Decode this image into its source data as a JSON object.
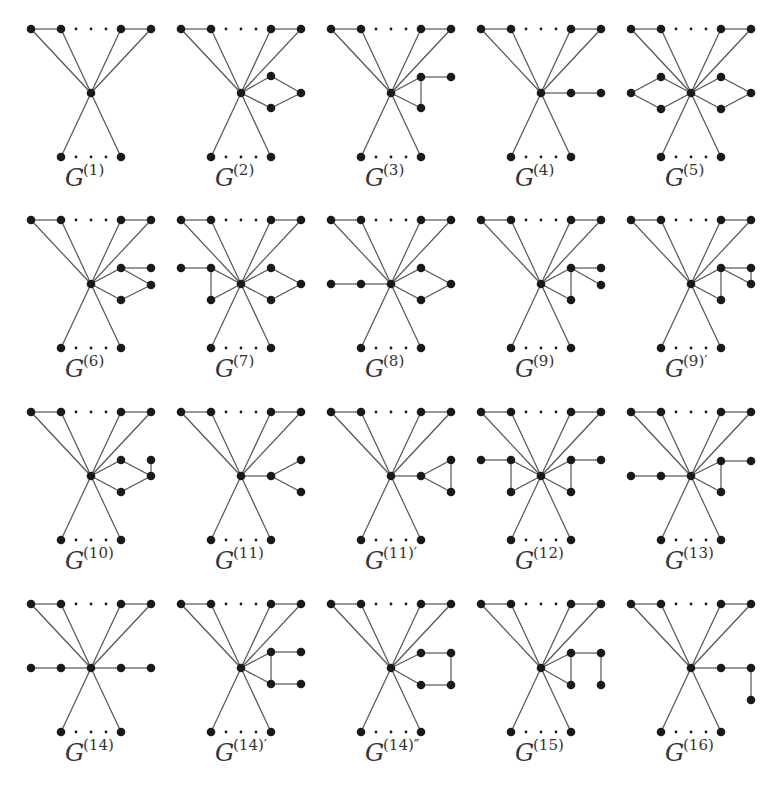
{
  "figure": {
    "caption_fragment": "",
    "colors": {
      "edge": "#555555",
      "node": "#1a1a1a",
      "label": "#333333",
      "background": "#ffffff"
    },
    "grid": {
      "columns": 5,
      "rows": 4,
      "col_width": 150,
      "first_center_x": 91,
      "row_center_y": [
        93,
        284,
        476,
        668
      ]
    },
    "base_structure": {
      "top_row": "four vertices at offsets -60,-30,+30,+60 (dy -64) with edges between outer pairs and dotted gap in the middle, all joined to center",
      "bottom_row": "two vertices at offsets -30,+30 (dy +64) joined to center, dotted gap between them"
    },
    "graphs": [
      {
        "id": "G1",
        "label": "G",
        "sup": "(1)",
        "row": 0,
        "col": 0,
        "nodes": [],
        "edges": []
      },
      {
        "id": "G2",
        "label": "G",
        "sup": "(2)",
        "row": 0,
        "col": 1,
        "nodes": [
          [
            30,
            -17
          ],
          [
            30,
            15
          ],
          [
            60,
            0
          ]
        ],
        "edges": [
          [
            "c",
            0
          ],
          [
            "c",
            1
          ],
          [
            0,
            2
          ],
          [
            1,
            2
          ]
        ]
      },
      {
        "id": "G3",
        "label": "G",
        "sup": "(3)",
        "row": 0,
        "col": 2,
        "nodes": [
          [
            30,
            -16
          ],
          [
            60,
            -16
          ],
          [
            30,
            15
          ]
        ],
        "edges": [
          [
            "c",
            0
          ],
          [
            "c",
            2
          ],
          [
            0,
            1
          ],
          [
            0,
            2
          ]
        ]
      },
      {
        "id": "G4",
        "label": "G",
        "sup": "(4)",
        "row": 0,
        "col": 3,
        "nodes": [
          [
            30,
            0
          ],
          [
            60,
            0
          ]
        ],
        "edges": [
          [
            "c",
            0
          ],
          [
            0,
            1
          ]
        ]
      },
      {
        "id": "G5",
        "label": "G",
        "sup": "(5)",
        "row": 0,
        "col": 4,
        "nodes": [
          [
            30,
            -16
          ],
          [
            30,
            16
          ],
          [
            60,
            0
          ],
          [
            -30,
            -16
          ],
          [
            -30,
            16
          ],
          [
            -60,
            0
          ]
        ],
        "edges": [
          [
            "c",
            0
          ],
          [
            "c",
            1
          ],
          [
            0,
            2
          ],
          [
            1,
            2
          ],
          [
            "c",
            3
          ],
          [
            "c",
            4
          ],
          [
            3,
            5
          ],
          [
            4,
            5
          ]
        ]
      },
      {
        "id": "G6",
        "label": "G",
        "sup": "(6)",
        "row": 1,
        "col": 0,
        "nodes": [
          [
            30,
            -16
          ],
          [
            60,
            -16
          ],
          [
            60,
            1
          ],
          [
            30,
            16
          ]
        ],
        "edges": [
          [
            "c",
            0
          ],
          [
            "c",
            3
          ],
          [
            0,
            1
          ],
          [
            0,
            2
          ],
          [
            3,
            2
          ]
        ]
      },
      {
        "id": "G7",
        "label": "G",
        "sup": "(7)",
        "row": 1,
        "col": 1,
        "nodes": [
          [
            30,
            -16
          ],
          [
            30,
            16
          ],
          [
            60,
            0
          ],
          [
            -30,
            -16
          ],
          [
            -60,
            -16
          ],
          [
            -30,
            16
          ]
        ],
        "edges": [
          [
            "c",
            0
          ],
          [
            "c",
            1
          ],
          [
            0,
            2
          ],
          [
            1,
            2
          ],
          [
            "c",
            3
          ],
          [
            "c",
            5
          ],
          [
            3,
            4
          ],
          [
            3,
            5
          ]
        ]
      },
      {
        "id": "G8",
        "label": "G",
        "sup": "(8)",
        "row": 1,
        "col": 2,
        "nodes": [
          [
            30,
            -16
          ],
          [
            30,
            16
          ],
          [
            60,
            0
          ],
          [
            -30,
            0
          ],
          [
            -60,
            0
          ]
        ],
        "edges": [
          [
            "c",
            0
          ],
          [
            "c",
            1
          ],
          [
            0,
            2
          ],
          [
            1,
            2
          ],
          [
            "c",
            3
          ],
          [
            3,
            4
          ]
        ]
      },
      {
        "id": "G9",
        "label": "G",
        "sup": "(9)",
        "row": 1,
        "col": 3,
        "nodes": [
          [
            30,
            -16
          ],
          [
            60,
            -16
          ],
          [
            60,
            1
          ],
          [
            30,
            16
          ]
        ],
        "edges": [
          [
            "c",
            0
          ],
          [
            "c",
            3
          ],
          [
            0,
            1
          ],
          [
            0,
            2
          ],
          [
            0,
            3
          ]
        ]
      },
      {
        "id": "G9p",
        "label": "G",
        "sup": "(9)′",
        "row": 1,
        "col": 4,
        "nodes": [
          [
            30,
            -16
          ],
          [
            60,
            -16
          ],
          [
            60,
            0
          ],
          [
            30,
            16
          ]
        ],
        "edges": [
          [
            "c",
            0
          ],
          [
            "c",
            3
          ],
          [
            0,
            1
          ],
          [
            0,
            2
          ],
          [
            1,
            2
          ],
          [
            0,
            3
          ]
        ]
      },
      {
        "id": "G10",
        "label": "G",
        "sup": "(10)",
        "row": 2,
        "col": 0,
        "nodes": [
          [
            30,
            -16
          ],
          [
            30,
            16
          ],
          [
            60,
            0
          ],
          [
            60,
            -16
          ]
        ],
        "edges": [
          [
            "c",
            0
          ],
          [
            "c",
            1
          ],
          [
            0,
            2
          ],
          [
            1,
            2
          ],
          [
            2,
            3
          ]
        ]
      },
      {
        "id": "G11",
        "label": "G",
        "sup": "(11)",
        "row": 2,
        "col": 1,
        "nodes": [
          [
            30,
            0
          ],
          [
            60,
            -16
          ],
          [
            60,
            16
          ]
        ],
        "edges": [
          [
            "c",
            0
          ],
          [
            0,
            1
          ],
          [
            0,
            2
          ]
        ]
      },
      {
        "id": "G11p",
        "label": "G",
        "sup": "(11)′",
        "row": 2,
        "col": 2,
        "nodes": [
          [
            30,
            0
          ],
          [
            60,
            -16
          ],
          [
            60,
            16
          ]
        ],
        "edges": [
          [
            "c",
            0
          ],
          [
            0,
            1
          ],
          [
            0,
            2
          ],
          [
            1,
            2
          ]
        ]
      },
      {
        "id": "G12",
        "label": "G",
        "sup": "(12)",
        "row": 2,
        "col": 3,
        "nodes": [
          [
            30,
            -16
          ],
          [
            60,
            -16
          ],
          [
            30,
            16
          ],
          [
            -30,
            -16
          ],
          [
            -60,
            -16
          ],
          [
            -30,
            16
          ]
        ],
        "edges": [
          [
            "c",
            0
          ],
          [
            "c",
            2
          ],
          [
            0,
            1
          ],
          [
            0,
            2
          ],
          [
            "c",
            3
          ],
          [
            "c",
            5
          ],
          [
            3,
            4
          ],
          [
            3,
            5
          ]
        ]
      },
      {
        "id": "G13",
        "label": "G",
        "sup": "(13)",
        "row": 2,
        "col": 4,
        "nodes": [
          [
            30,
            -15
          ],
          [
            60,
            -15
          ],
          [
            30,
            16
          ],
          [
            -30,
            0
          ],
          [
            -60,
            0
          ]
        ],
        "edges": [
          [
            "c",
            0
          ],
          [
            "c",
            2
          ],
          [
            0,
            1
          ],
          [
            0,
            2
          ],
          [
            "c",
            3
          ],
          [
            3,
            4
          ]
        ]
      },
      {
        "id": "G14",
        "label": "G",
        "sup": "(14)",
        "row": 3,
        "col": 0,
        "nodes": [
          [
            30,
            0
          ],
          [
            60,
            0
          ],
          [
            -30,
            0
          ],
          [
            -60,
            0
          ]
        ],
        "edges": [
          [
            "c",
            0
          ],
          [
            0,
            1
          ],
          [
            "c",
            2
          ],
          [
            2,
            3
          ]
        ]
      },
      {
        "id": "G14p",
        "label": "G",
        "sup": "(14)′",
        "row": 3,
        "col": 1,
        "nodes": [
          [
            30,
            -16
          ],
          [
            60,
            -16
          ],
          [
            30,
            16
          ],
          [
            60,
            16
          ]
        ],
        "edges": [
          [
            "c",
            0
          ],
          [
            "c",
            2
          ],
          [
            0,
            1
          ],
          [
            0,
            2
          ],
          [
            2,
            3
          ]
        ]
      },
      {
        "id": "G14pp",
        "label": "G",
        "sup": "(14)″",
        "row": 3,
        "col": 2,
        "nodes": [
          [
            30,
            -15
          ],
          [
            60,
            -15
          ],
          [
            30,
            17
          ],
          [
            60,
            17
          ]
        ],
        "edges": [
          [
            "c",
            0
          ],
          [
            "c",
            2
          ],
          [
            0,
            1
          ],
          [
            1,
            3
          ],
          [
            2,
            3
          ]
        ]
      },
      {
        "id": "G15",
        "label": "G",
        "sup": "(15)",
        "row": 3,
        "col": 3,
        "nodes": [
          [
            30,
            -15
          ],
          [
            60,
            -15
          ],
          [
            30,
            17
          ],
          [
            60,
            17
          ]
        ],
        "edges": [
          [
            "c",
            0
          ],
          [
            "c",
            2
          ],
          [
            0,
            1
          ],
          [
            0,
            2
          ],
          [
            1,
            3
          ]
        ]
      },
      {
        "id": "G16",
        "label": "G",
        "sup": "(16)",
        "row": 3,
        "col": 4,
        "nodes": [
          [
            30,
            0
          ],
          [
            60,
            0
          ],
          [
            60,
            32
          ]
        ],
        "edges": [
          [
            "c",
            0
          ],
          [
            0,
            1
          ],
          [
            1,
            2
          ]
        ]
      }
    ]
  }
}
